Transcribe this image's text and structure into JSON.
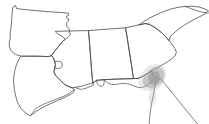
{
  "map": {
    "title": "Southeastern United States outline map",
    "background_color": "#ffffff",
    "line_color": "#4c4c4c",
    "highlight_color": "#9a9a9a",
    "width": 209,
    "height": 124,
    "regions": [
      {
        "id": "arkansas",
        "label": "Arkansas"
      },
      {
        "id": "louisiana",
        "label": "Louisiana"
      },
      {
        "id": "mississippi",
        "label": "Mississippi"
      },
      {
        "id": "alabama",
        "label": "Alabama"
      },
      {
        "id": "georgia",
        "label": "Georgia"
      },
      {
        "id": "south-carolina",
        "label": "South Carolina"
      },
      {
        "id": "florida",
        "label": "Florida"
      }
    ],
    "highlight": {
      "label": "Highlighted area",
      "description": "Shaded region near the Georgia / Florida / Alabama junction"
    }
  }
}
